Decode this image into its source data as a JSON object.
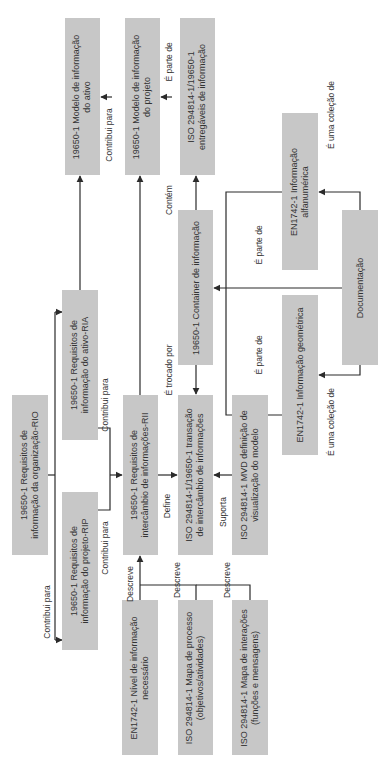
{
  "diagram": {
    "orientation": "rotated-90-ccw",
    "colors": {
      "box_fill": "#c7c7c7",
      "line": "#2b2b2b",
      "text": "#333333"
    },
    "boxes": {
      "rio": {
        "line1": "19650-1 Requisitos de",
        "line2": "informação da organização-RIO"
      },
      "ria": {
        "line1": "19650-1 Requisitos de",
        "line2": "informação do ativo-RIA"
      },
      "rip": {
        "line1": "19650-1 Requisitos de",
        "line2": "informação do projeto-RIP"
      },
      "modelo_ativo": {
        "line1": "19650-1 Modelo de informação",
        "line2": "do ativo"
      },
      "modelo_projeto": {
        "line1": "19650-1 Modelo de informação",
        "line2": "do projeto"
      },
      "entregaveis": {
        "line1": "ISO 294814-1/19650-1",
        "line2": "entregáveis de informação"
      },
      "rii": {
        "line1": "19650-1 Requisitos de",
        "line2": "intercâmbio de informações-RII"
      },
      "transacao": {
        "line1": "ISO 294814-1/19650-1 transação",
        "line2": "de intercâmbio de informações"
      },
      "mvd": {
        "line1": "ISO 294814-1 MVD definição de",
        "line2": "visualização do modelo"
      },
      "container": {
        "line1": "19650-1 Container de informação"
      },
      "nivel": {
        "line1": "EN1742-1 Nível de informação",
        "line2": "necessário"
      },
      "mapa_processo": {
        "line1": "ISO 294814-1 Mapa de processo",
        "line2": "(objetivos/atividades)"
      },
      "mapa_interacoes": {
        "line1": "ISO 294814-1 Mapa de interações",
        "line2": "(funções e mensagens)"
      },
      "alfanumerica": {
        "line1": "EN1742-1 Informação",
        "line2": "alfanumérica"
      },
      "geometrica": {
        "line1": "EN1742-1 Informação geométrica"
      },
      "documentacao": {
        "line1": "Documentação"
      }
    },
    "labels": {
      "contribui_rip": "Contribui para",
      "contribui_rio_rip": "Contribui para",
      "contribui_ria": "Contribui para",
      "contribui_modelo": "Contribui para",
      "e_parte_de_entregaveis": "É parte de",
      "contem": "Contém",
      "e_trocado_por": "É trocado por",
      "define": "Define",
      "suporta": "Suporta",
      "descreve_1": "Descreve",
      "descreve_2": "Descreve",
      "descreve_3": "Descreve",
      "e_parte_de_alfa": "É parte de",
      "e_parte_de_geo": "É parte de",
      "e_uma_colecao_alfa": "É uma coleção de",
      "e_uma_colecao_geo": "É uma coleção de"
    }
  }
}
